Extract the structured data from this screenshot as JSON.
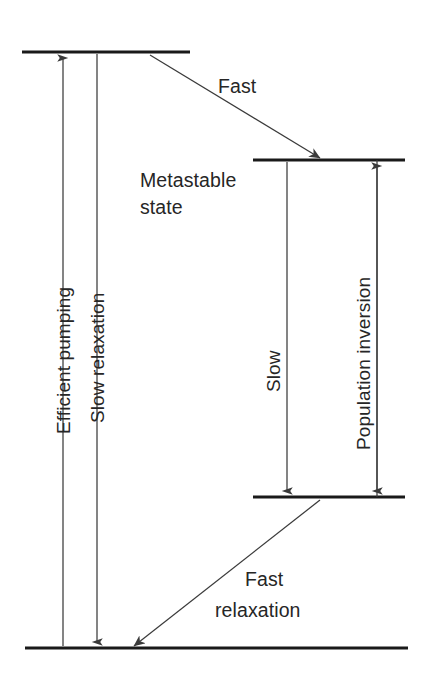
{
  "diagram": {
    "colors": {
      "level_line": "#1a1a1a",
      "arrow": "#3a3a3a",
      "text": "#262626",
      "background": "#ffffff"
    },
    "levels": [
      {
        "id": "pump-level",
        "name": "pump level",
        "label": "",
        "x1": 22,
        "x2": 190,
        "y": 52
      },
      {
        "id": "metastable-level",
        "name": "metastable state",
        "label": "Metastable\nstate",
        "x1": 253,
        "x2": 405,
        "y": 160
      },
      {
        "id": "lower-laser-level",
        "name": "lower laser level",
        "label": "",
        "x1": 253,
        "x2": 405,
        "y": 497
      },
      {
        "id": "ground-level",
        "name": "ground state",
        "label": "",
        "x1": 25,
        "x2": 408,
        "y": 648
      }
    ],
    "labels": {
      "metastable_line1": "Metastable",
      "metastable_line2": "state",
      "fast": "Fast",
      "fast_relaxation_line1": "Fast",
      "fast_relaxation_line2": "relaxation",
      "efficient_pumping": "Efficient pumping",
      "slow_relaxation": "Slow relaxation",
      "slow": "Slow",
      "population_inversion": "Population inversion"
    },
    "transitions": [
      {
        "id": "efficient-pumping",
        "label": "Efficient pumping",
        "direction": "up",
        "kind": "vertical",
        "x": 63,
        "y_from": 648,
        "y_to": 52
      },
      {
        "id": "slow-relaxation",
        "label": "Slow relaxation",
        "direction": "down",
        "kind": "vertical",
        "x": 97,
        "y_from": 52,
        "y_to": 648
      },
      {
        "id": "fast-decay",
        "label": "Fast",
        "direction": "down-right",
        "kind": "diagonal",
        "x_from": 150,
        "y_from": 55,
        "x_to": 317,
        "y_to": 158
      },
      {
        "id": "slow-lasing",
        "label": "Slow",
        "direction": "down",
        "kind": "vertical",
        "x": 287,
        "y_from": 160,
        "y_to": 497
      },
      {
        "id": "population-inversion",
        "label": "Population inversion",
        "direction": "both",
        "kind": "vertical",
        "x": 377,
        "y_from": 160,
        "y_to": 497
      },
      {
        "id": "fast-relaxation",
        "label": "Fast relaxation",
        "direction": "down-left",
        "kind": "diagonal",
        "x_from": 318,
        "y_from": 500,
        "x_to": 137,
        "y_to": 645
      }
    ]
  }
}
